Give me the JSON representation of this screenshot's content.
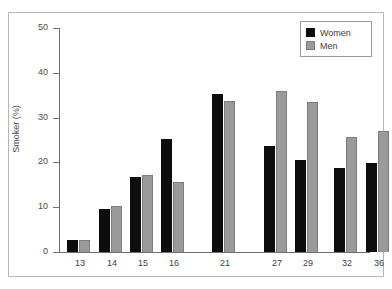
{
  "chart_data": {
    "type": "bar",
    "title": "",
    "xlabel": "",
    "ylabel": "Smoker (%)",
    "ylim": [
      0,
      50
    ],
    "yticks": [
      0,
      10,
      20,
      30,
      40,
      50
    ],
    "ytick_labels": [
      "0",
      "10",
      "20",
      "30",
      "40",
      "50"
    ],
    "grid": false,
    "legend_position": "top-right",
    "categories": [
      "13",
      "14",
      "15",
      "16",
      "21",
      "27",
      "29",
      "32",
      "36"
    ],
    "series": [
      {
        "name": "Women",
        "color": "#0d0d0d",
        "values": [
          2.7,
          9.7,
          16.7,
          25.3,
          35.2,
          23.7,
          20.5,
          18.8,
          19.9
        ]
      },
      {
        "name": "Men",
        "color": "#9a9a9a",
        "values": [
          2.6,
          10.3,
          17.1,
          15.7,
          33.8,
          35.9,
          33.4,
          25.7,
          27.1
        ]
      }
    ]
  },
  "legend": {
    "entries": [
      {
        "label": "Women",
        "swatch": "women"
      },
      {
        "label": "Men",
        "swatch": "men"
      }
    ]
  }
}
